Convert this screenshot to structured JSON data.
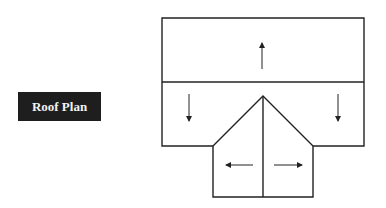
{
  "title": "Roof Plan",
  "diagram": {
    "type": "roof-plan",
    "stroke_color": "#222222",
    "label_bg": "#1e1e1e",
    "label_text_color": "#f2f2f2",
    "arrows": [
      {
        "name": "slope-up",
        "direction": "up"
      },
      {
        "name": "slope-down-left",
        "direction": "down"
      },
      {
        "name": "slope-down-right",
        "direction": "down"
      },
      {
        "name": "slope-left",
        "direction": "left"
      },
      {
        "name": "slope-right",
        "direction": "right"
      }
    ]
  }
}
